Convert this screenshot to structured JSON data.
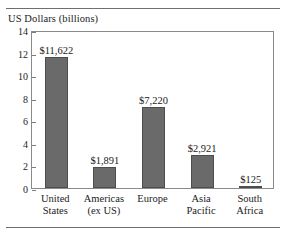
{
  "chart_data": {
    "type": "bar",
    "title": "",
    "ylabel": "US Dollars (billions)",
    "xlabel": "",
    "ylim": [
      0,
      14
    ],
    "yticks": [
      0,
      2,
      4,
      6,
      8,
      10,
      12,
      14
    ],
    "ytick_labels": [
      "0",
      "2",
      "4",
      "6",
      "8",
      "10",
      "12",
      "14"
    ],
    "grid": false,
    "legend": false,
    "bar_color": "#6a6a6a",
    "categories": [
      "United States",
      "Americas (ex US)",
      "Europe",
      "Asia Pacific",
      "South Africa"
    ],
    "category_lines": [
      [
        "United",
        "States"
      ],
      [
        "Americas",
        "(ex US)"
      ],
      [
        "Europe",
        ""
      ],
      [
        "Asia",
        "Pacific"
      ],
      [
        "South",
        "Africa"
      ]
    ],
    "values": [
      11.622,
      1.891,
      7.22,
      2.921,
      0.125
    ],
    "value_labels": [
      "$11,622",
      "$1,891",
      "$7,220",
      "$2,921",
      "$125"
    ]
  }
}
